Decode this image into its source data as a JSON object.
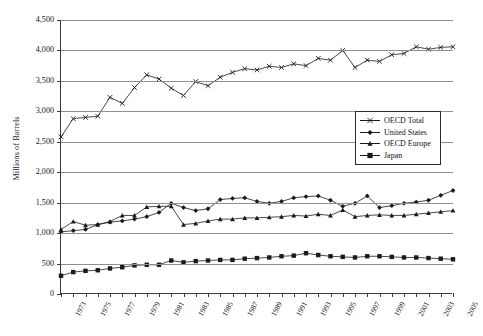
{
  "chart_data": {
    "type": "line",
    "title": "",
    "xlabel": "",
    "ylabel": "Millions of Barrels",
    "ylim": [
      0,
      4500
    ],
    "ytick_step": 500,
    "ytick_labels": [
      "4,500",
      "4,000",
      "3,500",
      "3,000",
      "2,500",
      "2,000",
      "1,500",
      "1,000",
      "500",
      "0"
    ],
    "ytick_values": [
      4500,
      4000,
      3500,
      3000,
      2500,
      2000,
      1500,
      1000,
      500,
      0
    ],
    "grid": "horizontal",
    "legend_position": "center-right",
    "x": [
      1973,
      1974,
      1975,
      1976,
      1977,
      1978,
      1979,
      1980,
      1981,
      1982,
      1983,
      1984,
      1985,
      1986,
      1987,
      1988,
      1989,
      1990,
      1991,
      1992,
      1993,
      1994,
      1995,
      1996,
      1997,
      1998,
      1999,
      2000,
      2001,
      2002,
      2003,
      2004,
      2005
    ],
    "xtick_labels": [
      "1973",
      "1975",
      "1977",
      "1979",
      "1981",
      "1983",
      "1985",
      "1987",
      "1989",
      "1991",
      "1993",
      "1995",
      "1997",
      "1999",
      "2001",
      "2003",
      "2005"
    ],
    "xlim": [
      1973,
      2005
    ],
    "series": [
      {
        "name": "OECD Total",
        "marker": "x",
        "color": "#1a1a1a",
        "values": [
          2580,
          2880,
          2900,
          2920,
          3230,
          3130,
          3390,
          3600,
          3530,
          3380,
          3260,
          3490,
          3420,
          3560,
          3640,
          3700,
          3680,
          3740,
          3720,
          3780,
          3750,
          3870,
          3840,
          4000,
          3720,
          3840,
          3820,
          3930,
          3950,
          4060,
          4020,
          4050,
          4060
        ]
      },
      {
        "name": "United States",
        "marker": "diamond",
        "color": "#1a1a1a",
        "values": [
          1020,
          1040,
          1060,
          1140,
          1180,
          1200,
          1230,
          1270,
          1340,
          1490,
          1420,
          1370,
          1400,
          1550,
          1570,
          1580,
          1520,
          1490,
          1520,
          1580,
          1600,
          1610,
          1540,
          1440,
          1490,
          1610,
          1420,
          1450,
          1490,
          1510,
          1540,
          1620,
          1700
        ]
      },
      {
        "name": "OECD Europe",
        "marker": "triangle",
        "color": "#1a1a1a",
        "values": [
          1060,
          1190,
          1130,
          1140,
          1190,
          1290,
          1290,
          1430,
          1440,
          1440,
          1140,
          1160,
          1200,
          1230,
          1230,
          1250,
          1250,
          1260,
          1270,
          1290,
          1280,
          1310,
          1290,
          1380,
          1270,
          1290,
          1300,
          1290,
          1290,
          1310,
          1330,
          1350,
          1370
        ]
      },
      {
        "name": "Japan",
        "marker": "square",
        "color": "#1a1a1a",
        "values": [
          300,
          360,
          380,
          390,
          420,
          440,
          470,
          480,
          480,
          550,
          520,
          540,
          550,
          560,
          560,
          580,
          590,
          600,
          620,
          630,
          670,
          640,
          620,
          610,
          600,
          620,
          620,
          610,
          600,
          600,
          590,
          580,
          570
        ]
      }
    ]
  }
}
